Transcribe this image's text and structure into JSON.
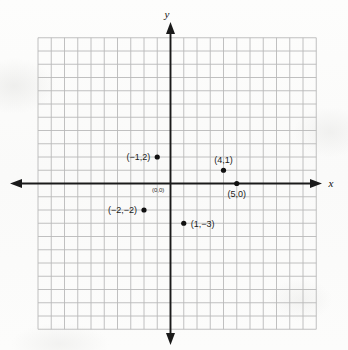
{
  "figure": {
    "kind": "coordinate-plane-scatter",
    "background_color": "#fbfbfa",
    "grid_color": "#b9b9b9",
    "axis_color": "#1a1a1a",
    "point_color": "#111111"
  },
  "axes": {
    "x_label": "x",
    "y_label": "y",
    "origin_label": "(0,0)"
  },
  "chart_data": {
    "type": "scatter",
    "title": "",
    "xlabel": "x",
    "ylabel": "y",
    "grid": true,
    "legend": "none",
    "xlim": [
      -10,
      11
    ],
    "ylim": [
      -11,
      11
    ],
    "tick_step": 1,
    "tick_labels": [],
    "points": [
      {
        "label": "(−1,2)",
        "x": -1,
        "y": 2,
        "label_side": "left"
      },
      {
        "label": "(4,1)",
        "x": 4,
        "y": 1,
        "label_side": "above"
      },
      {
        "label": "(5,0)",
        "x": 5,
        "y": 0,
        "label_side": "below"
      },
      {
        "label": "(−2,−2)",
        "x": -2,
        "y": -2,
        "label_side": "left"
      },
      {
        "label": "(1,−3)",
        "x": 1,
        "y": -3,
        "label_side": "right"
      }
    ]
  }
}
